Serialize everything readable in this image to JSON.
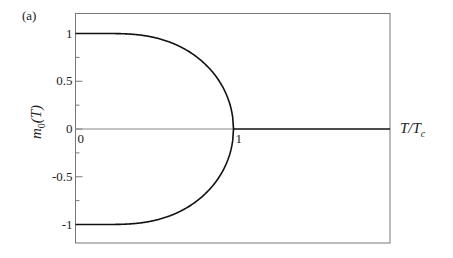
{
  "panel_label": "(a)",
  "chart_data": {
    "type": "line",
    "title": "",
    "panel": "(a)",
    "xlabel": "T/T_c",
    "ylabel": "m_0(T)",
    "xlim": [
      0,
      2.0
    ],
    "ylim": [
      -1.2,
      1.2
    ],
    "grid": false,
    "legend": null,
    "x_tick_labels": [
      {
        "value": 0,
        "label": "0"
      },
      {
        "value": 1,
        "label": "1"
      }
    ],
    "y_tick_labels": [
      {
        "value": 1,
        "label": "1"
      },
      {
        "value": 0.5,
        "label": "0.5"
      },
      {
        "value": 0,
        "label": "0"
      },
      {
        "value": -0.5,
        "label": "-0.5"
      },
      {
        "value": -1,
        "label": "-1"
      }
    ],
    "y_minor_ticks": [
      0.75,
      0.25,
      -0.25,
      -0.75
    ],
    "series": [
      {
        "name": "m0 positive branch",
        "x": [
          0,
          0.1,
          0.2,
          0.3,
          0.4,
          0.5,
          0.6,
          0.7,
          0.8,
          0.85,
          0.9,
          0.95,
          0.98,
          0.99,
          1.0
        ],
        "values": [
          1.0,
          1.0,
          0.9999,
          0.9974,
          0.9856,
          0.9575,
          0.9073,
          0.8286,
          0.7104,
          0.6294,
          0.5254,
          0.3794,
          0.2436,
          0.1725,
          0.0
        ]
      },
      {
        "name": "m0 negative branch",
        "x": [
          0,
          0.1,
          0.2,
          0.3,
          0.4,
          0.5,
          0.6,
          0.7,
          0.8,
          0.85,
          0.9,
          0.95,
          0.98,
          0.99,
          1.0
        ],
        "values": [
          -1.0,
          -1.0,
          -0.9999,
          -0.9974,
          -0.9856,
          -0.9575,
          -0.9073,
          -0.8286,
          -0.7104,
          -0.6294,
          -0.5254,
          -0.3794,
          -0.2436,
          -0.1725,
          0.0
        ]
      },
      {
        "name": "m0 = 0 (paramagnetic, T > Tc)",
        "x": [
          1.0,
          2.0
        ],
        "values": [
          0,
          0
        ]
      }
    ],
    "reference_lines": [
      {
        "name": "zero axis",
        "y": 0,
        "x_range": [
          0,
          1
        ],
        "style": "thin gray"
      }
    ]
  }
}
